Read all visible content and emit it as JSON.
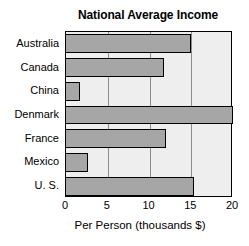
{
  "chart_data": {
    "type": "bar",
    "orientation": "horizontal",
    "title": "National Average Income",
    "xlabel": "Per Person (thousands $)",
    "ylabel": "",
    "xlim": [
      0,
      20
    ],
    "xticks": [
      0,
      5,
      10,
      15,
      20
    ],
    "xtick_labels": [
      "0",
      "5",
      "10",
      "15",
      "20"
    ],
    "grid": true,
    "grid_axis": "x",
    "legend": false,
    "categories": [
      "Australia",
      "Canada",
      "China",
      "Denmark",
      "France",
      "Mexico",
      "U. S."
    ],
    "values": [
      15.0,
      11.7,
      1.7,
      20.0,
      12.0,
      2.6,
      15.3
    ],
    "bars": [
      {
        "label": "Australia",
        "value": 15.0
      },
      {
        "label": "Canada",
        "value": 11.7
      },
      {
        "label": "China",
        "value": 1.7
      },
      {
        "label": "Denmark",
        "value": 20.0
      },
      {
        "label": "France",
        "value": 12.0
      },
      {
        "label": "Mexico",
        "value": 2.6
      },
      {
        "label": "U. S.",
        "value": 15.3
      }
    ],
    "colors": {
      "bar_fill": "#a6a6a6",
      "bar_stroke": "#000000",
      "plot_background": "#eeeeee",
      "axis": "#000000",
      "gridline": "#8c8c8c",
      "text": "#000000",
      "page_background": "#ffffff"
    }
  }
}
